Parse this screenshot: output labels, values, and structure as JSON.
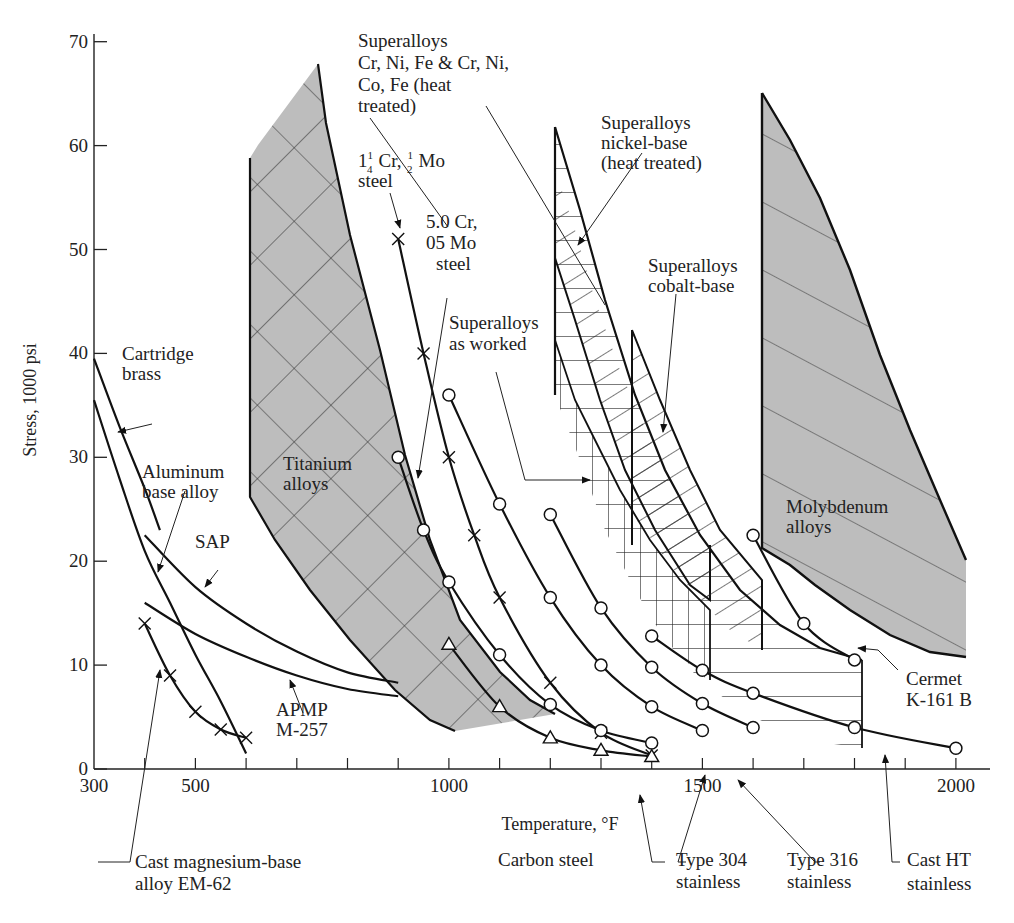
{
  "chart_data": {
    "type": "line",
    "title": "",
    "xlabel": "Temperature, °F",
    "ylabel": "Stress, 1000 psi",
    "xlim": [
      300,
      2050
    ],
    "ylim": [
      0,
      70
    ],
    "x_ticks_labeled": [
      300,
      500,
      1000,
      1500,
      2000
    ],
    "x_ticks_minor": [
      400,
      600,
      700,
      800,
      900,
      1100,
      1200,
      1300,
      1400,
      1600,
      1700,
      1800,
      1900
    ],
    "y_ticks": [
      0,
      10,
      20,
      30,
      40,
      50,
      60,
      70
    ],
    "grid": false,
    "legend": "none (direct labels with leader lines)",
    "series": [
      {
        "name": "Cartridge brass",
        "marker": "none",
        "x": [
          300,
          350,
          400,
          430
        ],
        "y": [
          39.5,
          33,
          27,
          23
        ]
      },
      {
        "name": "Aluminum base alloy",
        "marker": "none",
        "x": [
          300,
          350,
          400,
          450,
          500,
          550,
          600
        ],
        "y": [
          35.5,
          28,
          21,
          16,
          11,
          6.5,
          1.5
        ]
      },
      {
        "name": "SAP",
        "marker": "none",
        "x": [
          400,
          500,
          600,
          700,
          800,
          900
        ],
        "y": [
          22.5,
          17.5,
          14,
          11.3,
          9.3,
          8.3
        ]
      },
      {
        "name": "APMP M-257",
        "marker": "none",
        "x": [
          400,
          500,
          600,
          700,
          800,
          900
        ],
        "y": [
          16,
          13,
          10.8,
          9,
          7.7,
          7
        ]
      },
      {
        "name": "Cast magnesium-base alloy EM-62",
        "marker": "x",
        "x": [
          400,
          450,
          500,
          550,
          600
        ],
        "y": [
          14,
          9,
          5.5,
          3.8,
          3
        ]
      },
      {
        "name": "1 1/4 Cr, 1/2 Mo steel",
        "marker": "x",
        "x": [
          900,
          950,
          1000,
          1050,
          1100,
          1200,
          1300,
          1400
        ],
        "y": [
          51,
          40,
          30,
          22.5,
          16.5,
          8.3,
          3.5,
          1.3
        ]
      },
      {
        "name": "5.0 Cr, 05 Mo steel",
        "marker": "o",
        "x": [
          900,
          950,
          1000,
          1100,
          1200,
          1300,
          1400
        ],
        "y": [
          30,
          23,
          18,
          11,
          6.2,
          3.7,
          2.5
        ]
      },
      {
        "name": "Carbon steel",
        "marker": "triangle",
        "x": [
          1000,
          1100,
          1200,
          1300,
          1400
        ],
        "y": [
          12,
          6,
          3,
          1.8,
          1.2
        ]
      },
      {
        "name": "Type 304 stainless",
        "marker": "o",
        "x": [
          1000,
          1100,
          1200,
          1300,
          1400,
          1500
        ],
        "y": [
          36,
          25.5,
          16.5,
          10,
          6,
          3.7
        ]
      },
      {
        "name": "Type 316 stainless",
        "marker": "o",
        "x": [
          1200,
          1300,
          1400,
          1500,
          1600
        ],
        "y": [
          24.5,
          15.5,
          9.8,
          6.3,
          4
        ]
      },
      {
        "name": "Cast HT stainless",
        "marker": "o",
        "x": [
          1400,
          1500,
          1600,
          1800,
          2000
        ],
        "y": [
          12.8,
          9.5,
          7.3,
          4,
          2
        ]
      },
      {
        "name": "Cermet K-161 B",
        "marker": "o",
        "x": [
          1600,
          1700,
          1800
        ],
        "y": [
          22.5,
          14,
          10.5
        ]
      }
    ],
    "regions": [
      {
        "name": "Titanium alloys",
        "fill": "gray crosshatch",
        "x_range": [
          600,
          1200
        ],
        "upper_y": [
          59,
          68
        ],
        "lower_y": [
          26,
          3.5
        ]
      },
      {
        "name": "Superalloys Cr, Ni, Fe & Cr, Ni, Co, Fe (heat treated)",
        "fill": "diagonal hatch",
        "x_range": [
          1200,
          1500
        ]
      },
      {
        "name": "Superalloys nickel-base (heat treated)",
        "fill": "horizontal hatch",
        "x_range": [
          1200,
          1800
        ],
        "upper_y": [
          62,
          10.5
        ]
      },
      {
        "name": "Superalloys cobalt-base",
        "fill": "horizontal/diagonal hatch",
        "x_range": [
          1350,
          1800
        ],
        "upper_y": [
          42,
          10
        ]
      },
      {
        "name": "Superalloys as worked",
        "fill": "vertical hatch",
        "x_range": [
          1200,
          1500
        ]
      },
      {
        "name": "Molybdenum alloys",
        "fill": "gray diagonal hatch",
        "x_range": [
          1600,
          2000
        ],
        "upper_y": [
          65,
          20
        ],
        "lower_y": [
          22,
          11
        ]
      }
    ],
    "labels": {
      "x_axis_title": "Temperature, °F",
      "y_axis_title": "Stress, 1000 psi",
      "cartridge_brass": [
        "Cartridge",
        "brass"
      ],
      "aluminum": [
        "Aluminum",
        "base alloy"
      ],
      "sap": "SAP",
      "apmp": [
        "APMP",
        "M-257"
      ],
      "magnesium": [
        "Cast magnesium-base",
        "alloy EM-62"
      ],
      "titanium": [
        "Titanium",
        "alloys"
      ],
      "superalloys_crni": [
        "Superalloys",
        "Cr, Ni, Fe & Cr, Ni,",
        "Co, Fe (heat",
        "treated)"
      ],
      "crmo_1": [
        "Cr,",
        "Mo",
        "steel"
      ],
      "crmo_5": [
        "5.0 Cr,",
        "05 Mo",
        "steel"
      ],
      "superalloys_nickel": [
        "Superalloys",
        "nickel-base",
        "(heat treated)"
      ],
      "superalloys_cobalt": [
        "Superalloys",
        "cobalt-base"
      ],
      "superalloys_worked": [
        "Superalloys",
        "as worked"
      ],
      "molybdenum": [
        "Molybdenum",
        "alloys"
      ],
      "cermet": [
        "Cermet",
        "K-161 B"
      ],
      "carbon_steel": "Carbon steel",
      "type304": [
        "Type 304",
        "stainless"
      ],
      "type316": [
        "Type 316",
        "stainless"
      ],
      "cast_ht": [
        "Cast HT",
        "stainless"
      ]
    }
  }
}
